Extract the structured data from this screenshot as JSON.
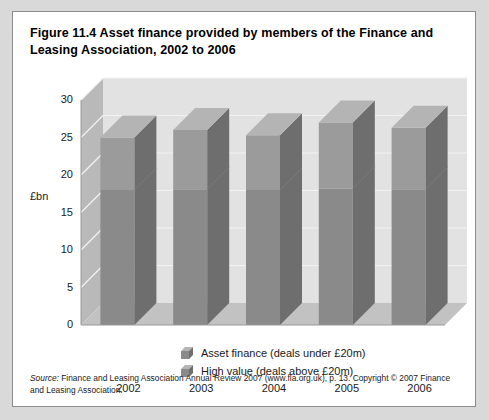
{
  "figure": {
    "title": "Figure 11.4  Asset finance provided by members of the Finance and Leasing Association, 2002 to 2006",
    "source_prefix": "Source:",
    "source_text": " Finance and Leasing Association Annual Review 2007 (www.fla.org.uk), p. 13. Copyright © 2007 Finance and Leasing Association."
  },
  "colors": {
    "bar_front_low": "#8a8a8a",
    "bar_front_high": "#9b9b9b",
    "bar_side": "#6e6e6e",
    "bar_top": "#b4b4b4",
    "plot_floor": "#c2c2c2",
    "plot_back": "#e2e2e2",
    "plot_wall": "#b9b9b9",
    "gridline": "#f2f2f2",
    "frame_border": "#8c8c8c",
    "page_background": "#d9d9d9"
  },
  "legend": {
    "items": [
      {
        "label": "Asset finance (deals under £20m)",
        "swatch": "cube-icon"
      },
      {
        "label": "High value (deals above £20m)",
        "swatch": "cube-icon"
      }
    ]
  },
  "chart_data": {
    "type": "bar",
    "title": "Asset finance provided by members of the Finance and Leasing Association, 2002 to 2006",
    "subtitle": "",
    "xlabel": "",
    "ylabel": "£bn",
    "ylim": [
      0,
      30
    ],
    "ytick_values": [
      0,
      5,
      10,
      15,
      20,
      25,
      30
    ],
    "ytick_labels": [
      "0",
      "5",
      "10",
      "15",
      "20",
      "25",
      "30"
    ],
    "categories": [
      "2002",
      "2003",
      "2004",
      "2005",
      "2006"
    ],
    "stacked": true,
    "grid": true,
    "legend_position": "bottom",
    "three_d": true,
    "series": [
      {
        "name": "Asset finance (deals under £20m)",
        "values": [
          18.0,
          18.1,
          18.0,
          18.2,
          18.1
        ]
      },
      {
        "name": "High value (deals above £20m)",
        "values": [
          7.0,
          7.9,
          7.3,
          8.8,
          8.2
        ]
      }
    ],
    "totals": [
      25.0,
      26.0,
      25.3,
      27.0,
      26.3
    ]
  }
}
